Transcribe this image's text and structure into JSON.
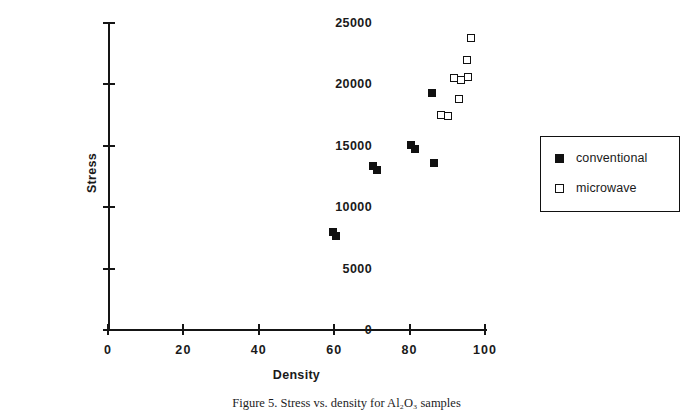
{
  "chart_data": {
    "type": "scatter",
    "title": "",
    "xlabel": "Density",
    "ylabel": "Stress",
    "xlim": [
      0,
      100
    ],
    "ylim": [
      0,
      25000
    ],
    "xticks": [
      0,
      20,
      40,
      60,
      80,
      100
    ],
    "yticks": [
      0,
      5000,
      10000,
      15000,
      20000,
      25000
    ],
    "xtick_labels": [
      "0",
      "20",
      "40",
      "60",
      "80",
      "100"
    ],
    "ytick_labels": [
      "0",
      "5000",
      "10000",
      "15000",
      "20000",
      "25000"
    ],
    "grid": false,
    "legend_position": "right",
    "series": [
      {
        "name": "conventional",
        "marker": "filled-square",
        "color": "#111111",
        "points": [
          {
            "x": 59.8,
            "y": 8000
          },
          {
            "x": 60.4,
            "y": 7650
          },
          {
            "x": 70.4,
            "y": 13350
          },
          {
            "x": 71.3,
            "y": 13050
          },
          {
            "x": 80.4,
            "y": 15050
          },
          {
            "x": 81.3,
            "y": 14750
          },
          {
            "x": 86.0,
            "y": 19300
          },
          {
            "x": 86.6,
            "y": 13600
          }
        ]
      },
      {
        "name": "microwave",
        "marker": "open-square",
        "color": "#ffffff",
        "points": [
          {
            "x": 88.2,
            "y": 17500
          },
          {
            "x": 90.3,
            "y": 17400
          },
          {
            "x": 91.8,
            "y": 20500
          },
          {
            "x": 93.6,
            "y": 20350
          },
          {
            "x": 95.4,
            "y": 20600
          },
          {
            "x": 93.2,
            "y": 18800
          },
          {
            "x": 95.3,
            "y": 22000
          },
          {
            "x": 96.4,
            "y": 23800
          }
        ]
      }
    ]
  },
  "legend": {
    "items": [
      {
        "label": "conventional",
        "marker": "filled-square"
      },
      {
        "label": "microwave",
        "marker": "open-square"
      }
    ]
  },
  "caption": {
    "text": "Figure 5. Stress vs. density for Al₂O₃ samples"
  }
}
